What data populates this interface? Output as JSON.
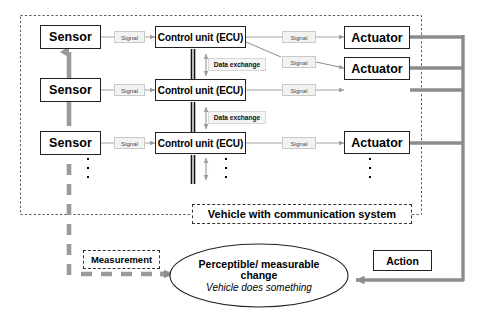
{
  "diagram": {
    "colors": {
      "ink": "#222222",
      "bus_gray": "#8c8c8c",
      "signal_gray": "#9a9a9a",
      "tag_fill": "#f2f2f2"
    }
  },
  "vehicle_boundary": {
    "label": "Vehicle with communication system"
  },
  "rows": [
    {
      "sensor": "Sensor",
      "ecu": "Control unit (ECU)",
      "signal_in": "Signal",
      "signal_out": "Signal",
      "actuator": "Actuator"
    },
    {
      "sensor": "Sensor",
      "ecu": "Control unit (ECU)",
      "signal_in": "Signal",
      "signal_out": "Signal",
      "actuator": ""
    },
    {
      "sensor": "Sensor",
      "ecu": "Control unit (ECU)",
      "signal_in": "Signal",
      "signal_out": "Signal",
      "actuator": "Actuator"
    }
  ],
  "extra_actuator": {
    "label": "Actuator",
    "signal": "Signal"
  },
  "bus": {
    "data_exchange_top": "Data exchange",
    "data_exchange_bottom": "Data exchange"
  },
  "feedback": {
    "measurement": "Measurement",
    "action": "Action"
  },
  "change_node": {
    "line1": "Perceptible/ measurable",
    "line2": "change",
    "line3": "Vehicle does something"
  },
  "ellipsis": {
    "glyph": "·"
  }
}
